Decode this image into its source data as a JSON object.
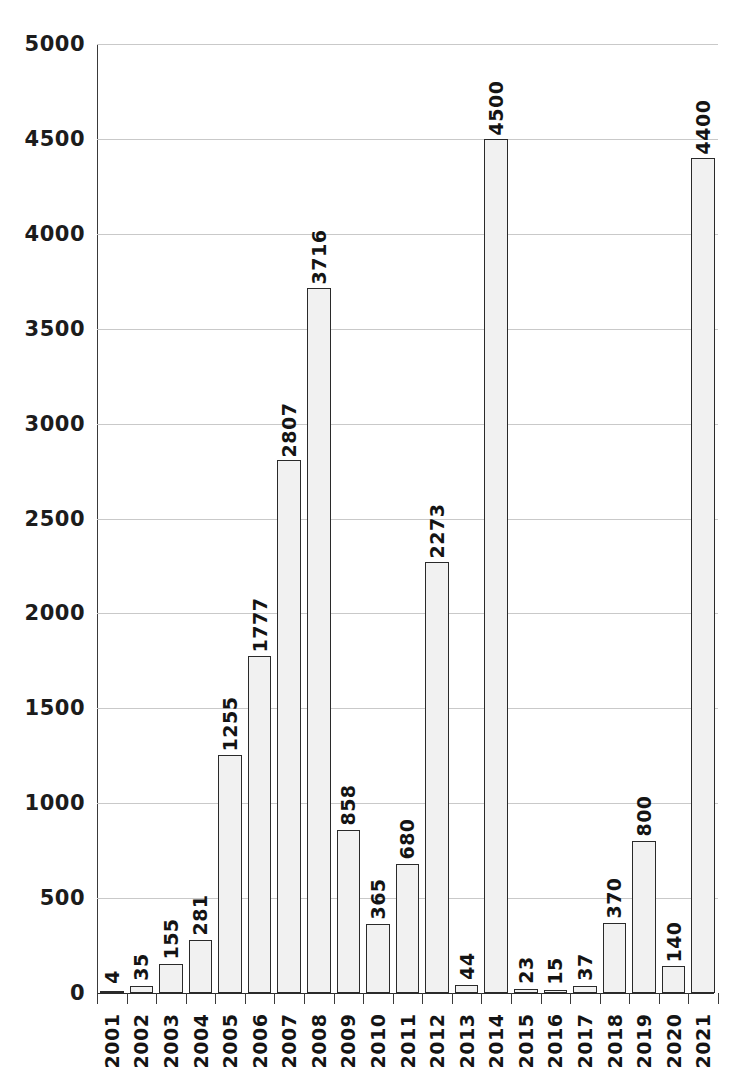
{
  "chart_data": {
    "type": "bar",
    "title": "",
    "subtitle": "",
    "xlabel": "",
    "ylabel": "",
    "ylim": [
      0,
      5000
    ],
    "ytick_step": 500,
    "yticks": [
      "0",
      "500",
      "1000",
      "1500",
      "2000",
      "2500",
      "3000",
      "3500",
      "4000",
      "4500",
      "5000"
    ],
    "grid": true,
    "legend": null,
    "bar_fill_color": "#f1f1f1",
    "bar_border_color": "#2a2a2a",
    "gridline_color": "#c9c9c9",
    "axis_color": "#3a3a3a",
    "data_labels_rotated": true,
    "categories": [
      "2001",
      "2002",
      "2003",
      "2004",
      "2005",
      "2006",
      "2007",
      "2008",
      "2009",
      "2010",
      "2011",
      "2012",
      "2013",
      "2014",
      "2015",
      "2016",
      "2017",
      "2018",
      "2019",
      "2020",
      "2021"
    ],
    "values": [
      4,
      35,
      155,
      281,
      1255,
      1777,
      2807,
      3716,
      858,
      365,
      680,
      2273,
      44,
      4500,
      23,
      15,
      37,
      370,
      800,
      140,
      4400
    ],
    "value_labels": [
      "4",
      "35",
      "155",
      "281",
      "1255",
      "1777",
      "2807",
      "3716",
      "858",
      "365",
      "680",
      "2273",
      "44",
      "4500",
      "23",
      "15",
      "37",
      "370",
      "800",
      "140",
      "4400"
    ]
  },
  "top_caption": ""
}
